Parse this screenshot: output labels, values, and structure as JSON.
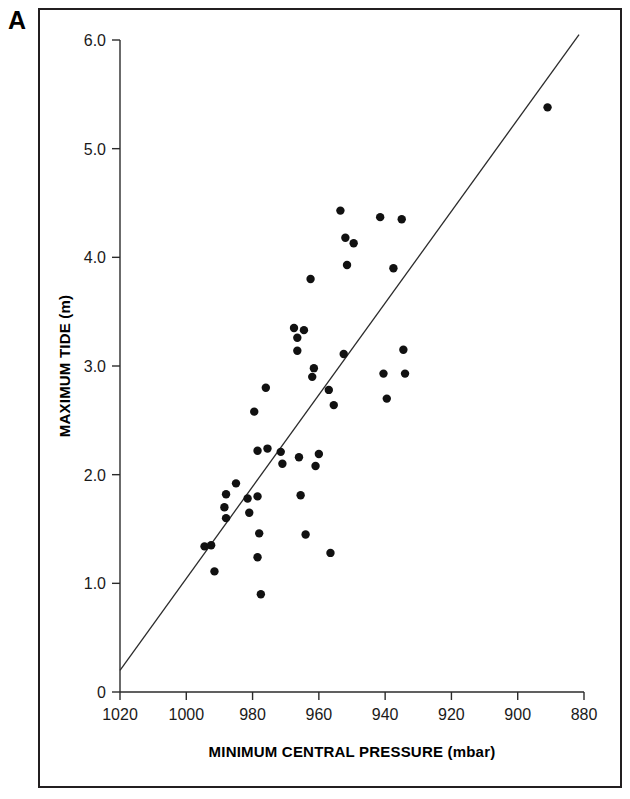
{
  "figure": {
    "panel_label": "A"
  },
  "chart_data": {
    "type": "scatter",
    "title": "",
    "xlabel": "MINIMUM CENTRAL PRESSURE (mbar)",
    "ylabel": "MAXIMUM TIDE (m)",
    "xlim": [
      1020,
      880
    ],
    "ylim": [
      0,
      6.0
    ],
    "x_reversed": true,
    "grid": false,
    "legend": null,
    "x_ticks": [
      1020,
      1000,
      980,
      960,
      940,
      920,
      900,
      880
    ],
    "x_tick_labels": [
      "1020",
      "1000",
      "980",
      "960",
      "940",
      "920",
      "900",
      "880"
    ],
    "y_ticks": [
      0,
      1.0,
      2.0,
      3.0,
      4.0,
      5.0,
      6.0
    ],
    "y_tick_labels": [
      "0",
      "1.0",
      "2.0",
      "3.0",
      "4.0",
      "5.0",
      "6.0"
    ],
    "points": [
      {
        "x": 994.5,
        "y": 1.34
      },
      {
        "x": 992.5,
        "y": 1.35
      },
      {
        "x": 991.5,
        "y": 1.11
      },
      {
        "x": 988.0,
        "y": 1.82
      },
      {
        "x": 988.5,
        "y": 1.7
      },
      {
        "x": 988.0,
        "y": 1.6
      },
      {
        "x": 985.0,
        "y": 1.92
      },
      {
        "x": 981.5,
        "y": 1.78
      },
      {
        "x": 981.0,
        "y": 1.65
      },
      {
        "x": 979.5,
        "y": 2.58
      },
      {
        "x": 978.5,
        "y": 1.8
      },
      {
        "x": 978.5,
        "y": 2.22
      },
      {
        "x": 978.0,
        "y": 1.46
      },
      {
        "x": 978.5,
        "y": 1.24
      },
      {
        "x": 977.5,
        "y": 0.9
      },
      {
        "x": 976.0,
        "y": 2.8
      },
      {
        "x": 975.5,
        "y": 2.24
      },
      {
        "x": 971.5,
        "y": 2.21
      },
      {
        "x": 971.0,
        "y": 2.1
      },
      {
        "x": 967.5,
        "y": 3.35
      },
      {
        "x": 966.5,
        "y": 3.26
      },
      {
        "x": 966.5,
        "y": 3.14
      },
      {
        "x": 966.0,
        "y": 2.16
      },
      {
        "x": 965.5,
        "y": 1.81
      },
      {
        "x": 964.5,
        "y": 3.33
      },
      {
        "x": 964.0,
        "y": 1.45
      },
      {
        "x": 962.5,
        "y": 3.8
      },
      {
        "x": 962.0,
        "y": 2.9
      },
      {
        "x": 961.5,
        "y": 2.98
      },
      {
        "x": 961.0,
        "y": 2.08
      },
      {
        "x": 960.0,
        "y": 2.19
      },
      {
        "x": 957.0,
        "y": 2.78
      },
      {
        "x": 956.5,
        "y": 1.28
      },
      {
        "x": 955.5,
        "y": 2.64
      },
      {
        "x": 953.5,
        "y": 4.43
      },
      {
        "x": 952.0,
        "y": 4.18
      },
      {
        "x": 952.5,
        "y": 3.11
      },
      {
        "x": 951.5,
        "y": 3.93
      },
      {
        "x": 949.5,
        "y": 4.13
      },
      {
        "x": 941.5,
        "y": 4.37
      },
      {
        "x": 940.5,
        "y": 2.93
      },
      {
        "x": 939.5,
        "y": 2.7
      },
      {
        "x": 937.5,
        "y": 3.9
      },
      {
        "x": 935.0,
        "y": 4.35
      },
      {
        "x": 934.5,
        "y": 3.15
      },
      {
        "x": 934.0,
        "y": 2.93
      },
      {
        "x": 891.0,
        "y": 5.38
      }
    ],
    "trend_line": {
      "x_start": 1020,
      "y_start": 0.2,
      "x_end": 881.5,
      "y_end": 6.05
    }
  }
}
